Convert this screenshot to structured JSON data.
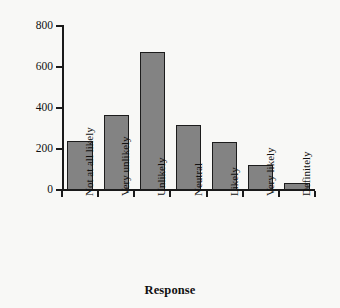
{
  "chart_data": {
    "type": "bar",
    "title": "",
    "xlabel": "Response",
    "ylabel": "Number of Responses",
    "categories": [
      "Not at all likely",
      "Very unlikely",
      "Unlikely",
      "Neutral",
      "Likely",
      "Very likely",
      "Definitely"
    ],
    "values": [
      240,
      368,
      675,
      316,
      234,
      120,
      34
    ],
    "ylim": [
      0,
      800
    ],
    "yticks": [
      0,
      200,
      400,
      600,
      800
    ],
    "ytick_labels": [
      "0",
      "200",
      "400",
      "600",
      "800"
    ],
    "grid": false,
    "legend": null,
    "colors": {
      "bar_fill": "#838383",
      "bar_edge": "#1c1c1c",
      "axis": "#1a1a1a",
      "text": "#111111",
      "background": "#f8f8f6"
    }
  }
}
